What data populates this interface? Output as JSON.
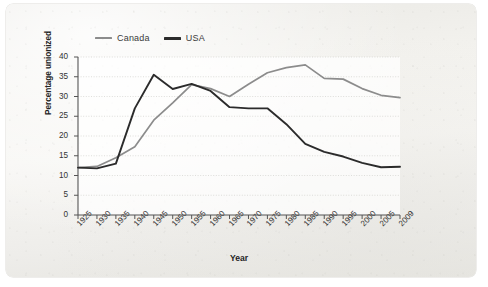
{
  "figure": {
    "background_color": "#f2f1ed",
    "plot_background_color": "#ffffff"
  },
  "legend": {
    "position": "top-left",
    "entries": [
      {
        "label": "Canada",
        "color": "#8c8c8c",
        "icon": "line-swatch-icon"
      },
      {
        "label": "USA",
        "color": "#2b2b2b",
        "icon": "line-swatch-icon"
      }
    ]
  },
  "axes": {
    "y_title": "Percentage unionized",
    "x_title": "Year",
    "y_ticks": [
      "0",
      "5",
      "10",
      "15",
      "20",
      "25",
      "30",
      "35",
      "40"
    ],
    "x_ticks": [
      "1925",
      "1930",
      "1935",
      "1940",
      "1945",
      "1950",
      "1955",
      "1960",
      "1965",
      "1970",
      "1975",
      "1980",
      "1985",
      "1990",
      "1995",
      "2000",
      "2005",
      "2009"
    ]
  },
  "chart_data": {
    "type": "line",
    "title": "",
    "xlabel": "Year",
    "ylabel": "Percentage unionized",
    "xlim": [
      1925,
      2009
    ],
    "ylim": [
      0,
      40
    ],
    "grid": true,
    "legend_position": "top-left",
    "x": [
      1925,
      1930,
      1935,
      1940,
      1945,
      1950,
      1955,
      1960,
      1965,
      1970,
      1975,
      1980,
      1985,
      1990,
      1995,
      2000,
      2005,
      2009
    ],
    "series": [
      {
        "name": "Canada",
        "color": "#8c8c8c",
        "values": [
          12.0,
          12.3,
          14.5,
          17.3,
          24.0,
          28.4,
          33.0,
          32.0,
          30.0,
          33.1,
          36.0,
          37.3,
          38.0,
          34.6,
          34.4,
          32.0,
          30.3,
          29.7
        ]
      },
      {
        "name": "USA",
        "color": "#2b2b2b",
        "values": [
          12.0,
          11.8,
          13.0,
          27.0,
          35.5,
          31.9,
          33.2,
          31.4,
          27.3,
          27.0,
          27.0,
          23.0,
          18.0,
          16.0,
          14.8,
          13.2,
          12.1,
          12.2
        ]
      }
    ],
    "annotations": []
  }
}
